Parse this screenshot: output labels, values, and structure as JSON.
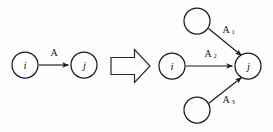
{
  "figure": {
    "background_color": "#fdfdfd",
    "ink_color": "#1a1a1a",
    "left_graph": {
      "name": "before-graph",
      "nodes": [
        {
          "id": "i",
          "label": "i",
          "cx": 25,
          "cy": 65,
          "r": 13
        },
        {
          "id": "j",
          "label": "j",
          "cx": 84,
          "cy": 65,
          "r": 13
        }
      ],
      "edges": [
        {
          "from": "i",
          "to": "j",
          "label": "A",
          "subscript": ""
        }
      ]
    },
    "transform_arrow": {
      "name": "implies-arrow",
      "glyph": "block-arrow-right"
    },
    "right_graph": {
      "name": "after-graph",
      "nodes": [
        {
          "id": "top",
          "label": "",
          "cx": 197,
          "cy": 21,
          "r": 13
        },
        {
          "id": "i",
          "label": "i",
          "cx": 172,
          "cy": 66,
          "r": 13
        },
        {
          "id": "j",
          "label": "j",
          "cx": 248,
          "cy": 66,
          "r": 13
        },
        {
          "id": "bottom",
          "label": "",
          "cx": 197,
          "cy": 110,
          "r": 13
        }
      ],
      "edges": [
        {
          "from": "top",
          "to": "j",
          "label": "A",
          "subscript": "1"
        },
        {
          "from": "i",
          "to": "j",
          "label": "A",
          "subscript": "2"
        },
        {
          "from": "bottom",
          "to": "j",
          "label": "A",
          "subscript": "3"
        }
      ]
    }
  }
}
